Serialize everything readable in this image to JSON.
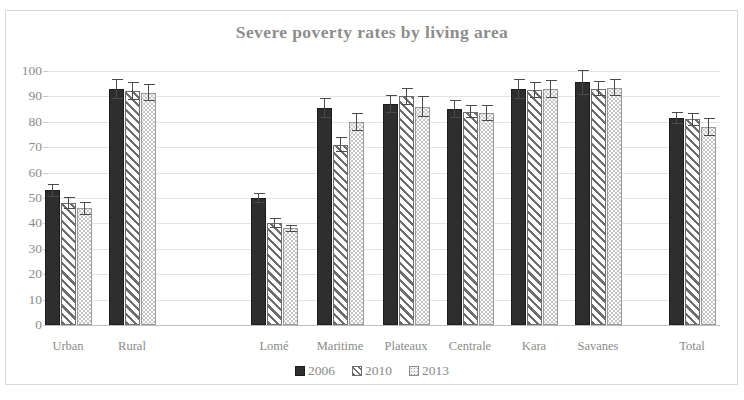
{
  "chart_data": {
    "type": "bar",
    "title": "Severe poverty rates by living area",
    "xlabel": "",
    "ylabel": "",
    "ylim": [
      0,
      100
    ],
    "yticks": [
      0,
      10,
      20,
      30,
      40,
      50,
      60,
      70,
      80,
      90,
      100
    ],
    "grid": true,
    "legend_position": "bottom",
    "error_bars": true,
    "categories": [
      "Urban",
      "Rural",
      "Lomé",
      "Maritime",
      "Plateaux",
      "Centrale",
      "Kara",
      "Savanes",
      "Total"
    ],
    "series": [
      {
        "name": "2006",
        "color": "#2e2e2e",
        "pattern": "solid",
        "values": [
          53,
          93,
          50,
          85.5,
          87,
          85,
          93,
          95.5,
          81.5
        ],
        "errors": [
          2.5,
          4.0,
          2.0,
          4.0,
          3.5,
          3.5,
          4.0,
          5.0,
          2.5
        ]
      },
      {
        "name": "2010",
        "color": "#6e6e6e",
        "pattern": "diagonal-hatch",
        "values": [
          48,
          92,
          40,
          71,
          90,
          84,
          92.5,
          93,
          81
        ],
        "errors": [
          2.5,
          3.5,
          2.0,
          3.0,
          3.5,
          2.5,
          3.0,
          3.0,
          2.5
        ]
      },
      {
        "name": "2013",
        "color": "#c2c2c2",
        "pattern": "dotted",
        "values": [
          46,
          91.5,
          38,
          80,
          86,
          83.5,
          93,
          93.5,
          78
        ],
        "errors": [
          2.5,
          3.5,
          1.5,
          3.5,
          4.0,
          3.0,
          3.5,
          3.5,
          3.5
        ]
      }
    ]
  },
  "legend": {
    "items": [
      {
        "label": "2006"
      },
      {
        "label": "2010"
      },
      {
        "label": "2013"
      }
    ]
  }
}
